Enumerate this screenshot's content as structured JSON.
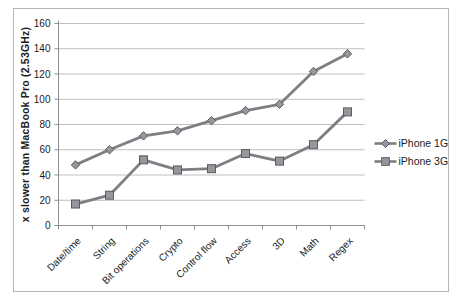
{
  "chart_data": {
    "type": "line",
    "title": "",
    "xlabel": "",
    "ylabel": "x slower than MacBook Pro (2.53GHz)",
    "categories": [
      "Date/time",
      "String",
      "Bit operations",
      "Crypto",
      "Control flow",
      "Access",
      "3D",
      "Math",
      "Regex"
    ],
    "series": [
      {
        "name": "iPhone 1G",
        "marker": "diamond",
        "values": [
          48,
          60,
          71,
          75,
          83,
          91,
          96,
          122,
          136
        ]
      },
      {
        "name": "iPhone 3GS",
        "marker": "square",
        "values": [
          17,
          24,
          52,
          44,
          45,
          57,
          51,
          64,
          90
        ]
      }
    ],
    "ylim": [
      0,
      160
    ],
    "yticks": [
      0,
      20,
      40,
      60,
      80,
      100,
      120,
      140,
      160
    ],
    "grid": true,
    "legend_position": "right",
    "x_tick_rotation": 45,
    "colors": {
      "line": "#7e7e84",
      "marker_fill": "#96969c",
      "marker_stroke": "#5a5a60",
      "gridline": "#b8b8b8",
      "axis": "#8f8f8f",
      "text": "#1c1c1c",
      "figure_border": "#b5b5b5"
    }
  }
}
